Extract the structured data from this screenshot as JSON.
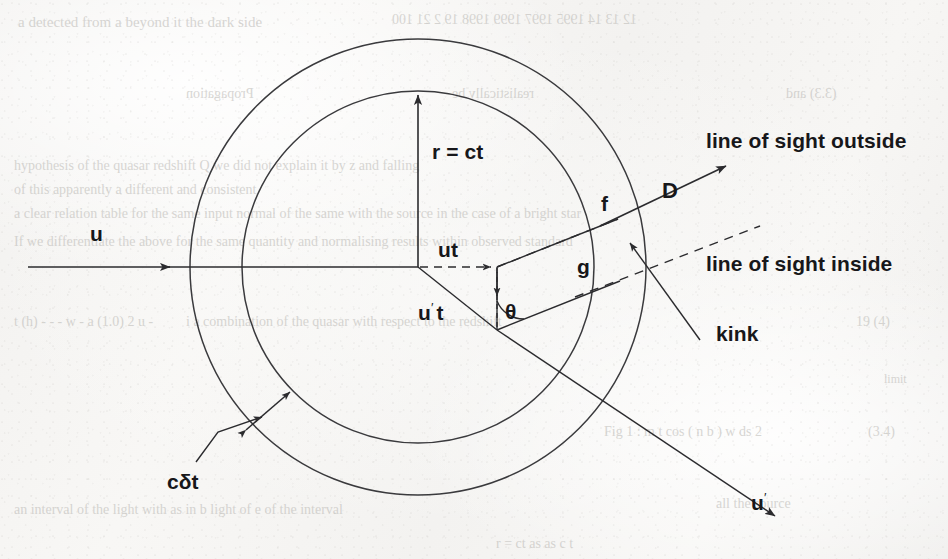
{
  "figure": {
    "kind": "scanned-physics-diagram",
    "page_background": "#f6f5f3",
    "ink_color": "#2b2b2e",
    "label_color": "#17171a"
  },
  "labels": {
    "radius": "r = ct",
    "shell_thickness": "cδt",
    "source_velocity": "u",
    "source_velocity_primed": "u",
    "source_velocity_primed_mark": "′",
    "displacement_ut": "ut",
    "displacement_uprime_t": "u",
    "displacement_uprime_t_mark": "′",
    "displacement_uprime_t_tail": "t",
    "angle": "θ",
    "point_f": "f",
    "point_g": "g",
    "vector_D": "D",
    "line_of_sight_outside": "line of sight outside",
    "line_of_sight_inside": "line of sight inside",
    "kink": "kink"
  },
  "geometry": {
    "center_x": 418,
    "center_y": 267,
    "outer_radius": 228,
    "inner_radius": 176,
    "kink_center_x": 497,
    "kink_center_y": 329,
    "ut_tip_x": 497,
    "ut_tip_y": 267,
    "f_x": 618,
    "f_y": 219,
    "g_x": 597,
    "g_y": 279
  },
  "ghost_text": [
    {
      "text": "a detected from a beyond  it  the  dark side",
      "x": 18,
      "y": 14,
      "size": 15,
      "flip": false
    },
    {
      "text": "12 13 14  1995  1997  1999  1998  19 2  21 100",
      "x": 392,
      "y": 12,
      "size": 14,
      "flip": true
    },
    {
      "text": "Propagation",
      "x": 186,
      "y": 86,
      "size": 14,
      "flip": true
    },
    {
      "text": "realistically be",
      "x": 452,
      "y": 86,
      "size": 14,
      "flip": true
    },
    {
      "text": "(3.3) and",
      "x": 786,
      "y": 86,
      "size": 14,
      "flip": true
    },
    {
      "text": "hypothesis  of  the  quasar  redshift   Q  we  did  not  explain  it  by  z  and  falling",
      "x": 14,
      "y": 158,
      "size": 14,
      "flip": false
    },
    {
      "text": "of this  apparently  a  different  and  consistent",
      "x": 14,
      "y": 182,
      "size": 14,
      "flip": false
    },
    {
      "text": "a  clear  relation  table  for  the  same  input  normal  of  the  same  with  the  source  in  the  case  of  a  bright  star",
      "x": 14,
      "y": 206,
      "size": 14,
      "flip": false
    },
    {
      "text": "If  we  differentiate  the  above  for  the  same  quantity  and  normalising  results  within  observed  standard",
      "x": 14,
      "y": 234,
      "size": 14,
      "flip": false
    },
    {
      "text": "t  (h)  -  -  -  w  -  a  (1.0)   2  u  -",
      "x": 14,
      "y": 314,
      "size": 14,
      "flip": false
    },
    {
      "text": "i  a  combination   of  the   quasar   with  respect  to  the  redshift",
      "x": 186,
      "y": 314,
      "size": 14,
      "flip": false
    },
    {
      "text": "19  (4)",
      "x": 856,
      "y": 314,
      "size": 14,
      "flip": false
    },
    {
      "text": "limit",
      "x": 884,
      "y": 372,
      "size": 12,
      "flip": false
    },
    {
      "text": "Fig  1  :   m  t  cos  (  n  b  )   w  ds  2",
      "x": 604,
      "y": 424,
      "size": 14,
      "flip": false
    },
    {
      "text": "(3.4)",
      "x": 868,
      "y": 424,
      "size": 14,
      "flip": false
    },
    {
      "text": "an  interval  of  the  light  with  as  in   b  light  of  e  of  the  interval",
      "x": 14,
      "y": 502,
      "size": 14,
      "flip": false
    },
    {
      "text": "all  the  source",
      "x": 716,
      "y": 496,
      "size": 14,
      "flip": false
    },
    {
      "text": "r  =  ct   as   as   c  t",
      "x": 496,
      "y": 536,
      "size": 14,
      "flip": false
    }
  ]
}
